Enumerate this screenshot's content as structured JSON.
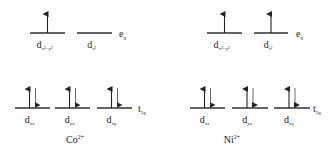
{
  "diagram": {
    "type": "crystal-field-splitting",
    "panels": [
      {
        "ion": "Co",
        "charge": "2+",
        "eg": {
          "label": "e",
          "label_sub": "g",
          "orbitals": [
            {
              "name": "d",
              "sub": "x²−y²",
              "electrons": [
                "up"
              ]
            },
            {
              "name": "d",
              "sub": "z²",
              "electrons": []
            }
          ]
        },
        "t2g": {
          "label": "t",
          "label_sub": "2g",
          "orbitals": [
            {
              "name": "d",
              "sub": "xz",
              "electrons": [
                "up",
                "down"
              ]
            },
            {
              "name": "d",
              "sub": "yz",
              "electrons": [
                "up",
                "down"
              ]
            },
            {
              "name": "d",
              "sub": "xy",
              "electrons": [
                "up",
                "down"
              ]
            }
          ]
        }
      },
      {
        "ion": "Ni",
        "charge": "2+",
        "eg": {
          "label": "e",
          "label_sub": "g",
          "orbitals": [
            {
              "name": "d",
              "sub": "x²−y²",
              "electrons": [
                "up"
              ]
            },
            {
              "name": "d",
              "sub": "z²",
              "electrons": [
                "up"
              ]
            }
          ]
        },
        "t2g": {
          "label": "t",
          "label_sub": "2g",
          "orbitals": [
            {
              "name": "d",
              "sub": "xz",
              "electrons": [
                "up",
                "down"
              ]
            },
            {
              "name": "d",
              "sub": "yz",
              "electrons": [
                "up",
                "down"
              ]
            },
            {
              "name": "d",
              "sub": "xy",
              "electrons": [
                "up",
                "down"
              ]
            }
          ]
        }
      }
    ]
  }
}
